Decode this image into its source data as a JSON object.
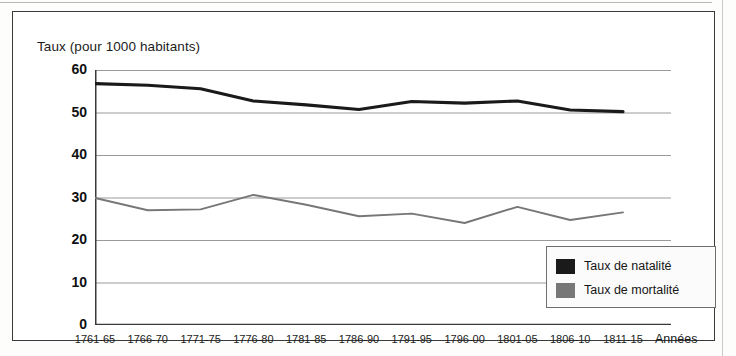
{
  "figure": {
    "title": "Taux (pour 1000 habitants)",
    "xaxis_title": "Années"
  },
  "legend": {
    "items": [
      {
        "label": "Taux de natalité",
        "color": "#1a1a1a"
      },
      {
        "label": "Taux de mortalité",
        "color": "#777777"
      }
    ]
  },
  "chart_data": {
    "type": "line",
    "title": "Taux (pour 1000 habitants)",
    "xlabel": "Années",
    "ylabel": "Taux (pour 1000 habitants)",
    "ylim": [
      0,
      60
    ],
    "yticks": [
      0,
      10,
      20,
      30,
      40,
      50,
      60
    ],
    "ytick_labels": [
      "0",
      "10",
      "20",
      "30",
      "40",
      "50",
      "60"
    ],
    "grid": true,
    "legend_position": "bottom-right",
    "categories": [
      "1761-65",
      "1766-70",
      "1771-75",
      "1776-80",
      "1781-85",
      "1786-90",
      "1791-95",
      "1796-00",
      "1801-05",
      "1806-10",
      "1811-15"
    ],
    "series": [
      {
        "name": "Taux de natalité",
        "color": "#1a1a1a",
        "values": [
          56.8,
          56.4,
          55.6,
          52.7,
          51.8,
          50.7,
          52.6,
          52.2,
          52.7,
          50.6,
          50.2
        ]
      },
      {
        "name": "Taux de mortalité",
        "color": "#777777",
        "values": [
          29.9,
          27.0,
          27.2,
          30.6,
          28.3,
          25.6,
          26.2,
          24.0,
          27.8,
          24.7,
          26.5
        ]
      }
    ]
  }
}
